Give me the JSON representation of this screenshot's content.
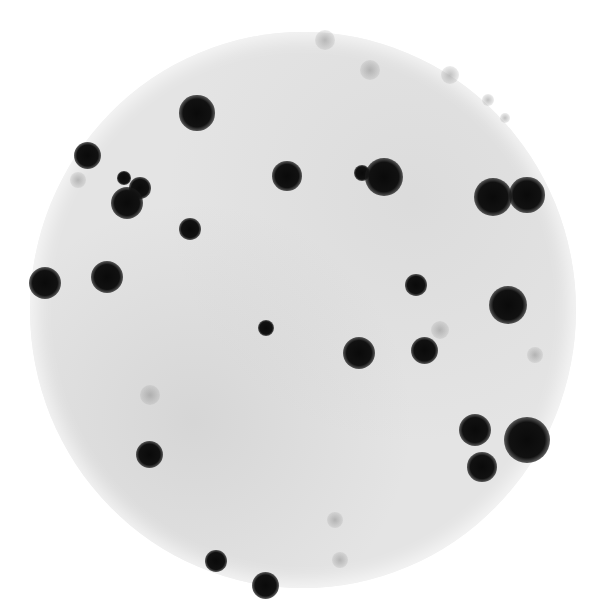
{
  "image": {
    "description": "Circular membrane / filter autoradiograph with dark hybridization spots on a light grey mottled background",
    "background_color": "#ffffff",
    "disc_color": "#e4e4e4",
    "spot_color": "#0a0a0a",
    "disc": {
      "cx": 303,
      "cy": 310,
      "rx": 273,
      "ry": 278
    }
  },
  "spots": [
    {
      "x": 197,
      "y": 113,
      "r": 13
    },
    {
      "x": 87,
      "y": 155,
      "r": 10
    },
    {
      "x": 124,
      "y": 178,
      "r": 5
    },
    {
      "x": 140,
      "y": 188,
      "r": 8
    },
    {
      "x": 127,
      "y": 203,
      "r": 12
    },
    {
      "x": 190,
      "y": 229,
      "r": 8
    },
    {
      "x": 45,
      "y": 283,
      "r": 12
    },
    {
      "x": 107,
      "y": 277,
      "r": 12
    },
    {
      "x": 287,
      "y": 176,
      "r": 11
    },
    {
      "x": 362,
      "y": 173,
      "r": 6
    },
    {
      "x": 384,
      "y": 177,
      "r": 14
    },
    {
      "x": 493,
      "y": 197,
      "r": 14
    },
    {
      "x": 527,
      "y": 195,
      "r": 13
    },
    {
      "x": 416,
      "y": 285,
      "r": 8
    },
    {
      "x": 508,
      "y": 305,
      "r": 14
    },
    {
      "x": 266,
      "y": 328,
      "r": 6
    },
    {
      "x": 359,
      "y": 353,
      "r": 12
    },
    {
      "x": 424,
      "y": 350,
      "r": 10
    },
    {
      "x": 149,
      "y": 454,
      "r": 10
    },
    {
      "x": 475,
      "y": 430,
      "r": 12
    },
    {
      "x": 527,
      "y": 440,
      "r": 17
    },
    {
      "x": 482,
      "y": 467,
      "r": 11
    },
    {
      "x": 216,
      "y": 561,
      "r": 8
    },
    {
      "x": 265,
      "y": 585,
      "r": 10
    }
  ],
  "faint_specks": [
    {
      "x": 325,
      "y": 40,
      "r": 10
    },
    {
      "x": 450,
      "y": 75,
      "r": 9
    },
    {
      "x": 488,
      "y": 100,
      "r": 6
    },
    {
      "x": 505,
      "y": 118,
      "r": 5
    },
    {
      "x": 78,
      "y": 180,
      "r": 8
    },
    {
      "x": 370,
      "y": 70,
      "r": 10
    },
    {
      "x": 150,
      "y": 395,
      "r": 10
    },
    {
      "x": 440,
      "y": 330,
      "r": 9
    },
    {
      "x": 535,
      "y": 355,
      "r": 8
    },
    {
      "x": 335,
      "y": 520,
      "r": 8
    },
    {
      "x": 340,
      "y": 560,
      "r": 8
    }
  ]
}
